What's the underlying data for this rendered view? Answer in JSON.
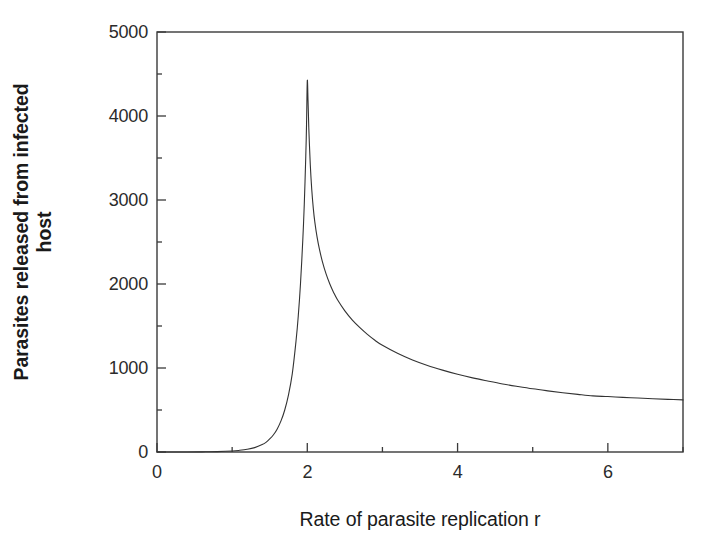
{
  "chart_data": {
    "type": "line",
    "title": "",
    "xlabel": "Rate of parasite replication r",
    "ylabel_line1": "Parasites released from infected",
    "ylabel_line2": "host",
    "xlim": [
      0,
      7
    ],
    "ylim": [
      0,
      5000
    ],
    "grid": false,
    "legend": null,
    "x_major_ticks": [
      0,
      2,
      4,
      6
    ],
    "x_minor_ticks": [
      1,
      3,
      5,
      7
    ],
    "x_tick_labels": [
      "0",
      "2",
      "4",
      "6"
    ],
    "y_major_ticks": [
      0,
      1000,
      2000,
      3000,
      4000,
      5000
    ],
    "y_minor_ticks": [
      500,
      1500,
      2500,
      3500,
      4500
    ],
    "y_tick_labels": [
      "0",
      "1000",
      "2000",
      "3000",
      "4000",
      "5000"
    ],
    "line_color": "#333333",
    "line_width": 1.1,
    "series": [
      {
        "name": "Parasites released",
        "x": [
          0.0,
          0.2,
          0.4,
          0.6,
          0.8,
          1.0,
          1.1,
          1.2,
          1.3,
          1.4,
          1.45,
          1.5,
          1.55,
          1.6,
          1.65,
          1.7,
          1.75,
          1.8,
          1.85,
          1.88,
          1.91,
          1.94,
          1.96,
          1.98,
          1.99,
          2.0,
          2.01,
          2.02,
          2.04,
          2.06,
          2.08,
          2.1,
          2.13,
          2.16,
          2.2,
          2.25,
          2.3,
          2.35,
          2.4,
          2.5,
          2.6,
          2.7,
          2.8,
          2.9,
          3.0,
          3.2,
          3.4,
          3.6,
          3.8,
          4.0,
          4.2,
          4.4,
          4.6,
          4.8,
          5.0,
          5.2,
          5.4,
          5.6,
          5.8,
          6.0,
          6.2,
          6.4,
          6.6,
          6.8,
          7.0
        ],
        "y": [
          0,
          0,
          0,
          2,
          5,
          12,
          20,
          32,
          52,
          88,
          115,
          155,
          205,
          275,
          370,
          500,
          680,
          930,
          1320,
          1620,
          2010,
          2520,
          2950,
          3520,
          3900,
          4420,
          4180,
          3860,
          3420,
          3120,
          2900,
          2740,
          2560,
          2420,
          2270,
          2120,
          2000,
          1900,
          1815,
          1680,
          1570,
          1480,
          1400,
          1330,
          1270,
          1175,
          1095,
          1030,
          975,
          925,
          882,
          845,
          810,
          780,
          752,
          728,
          706,
          686,
          668,
          660,
          650,
          642,
          634,
          627,
          620
        ]
      }
    ]
  },
  "axis": {
    "frame_color": "#3a3a3a"
  }
}
